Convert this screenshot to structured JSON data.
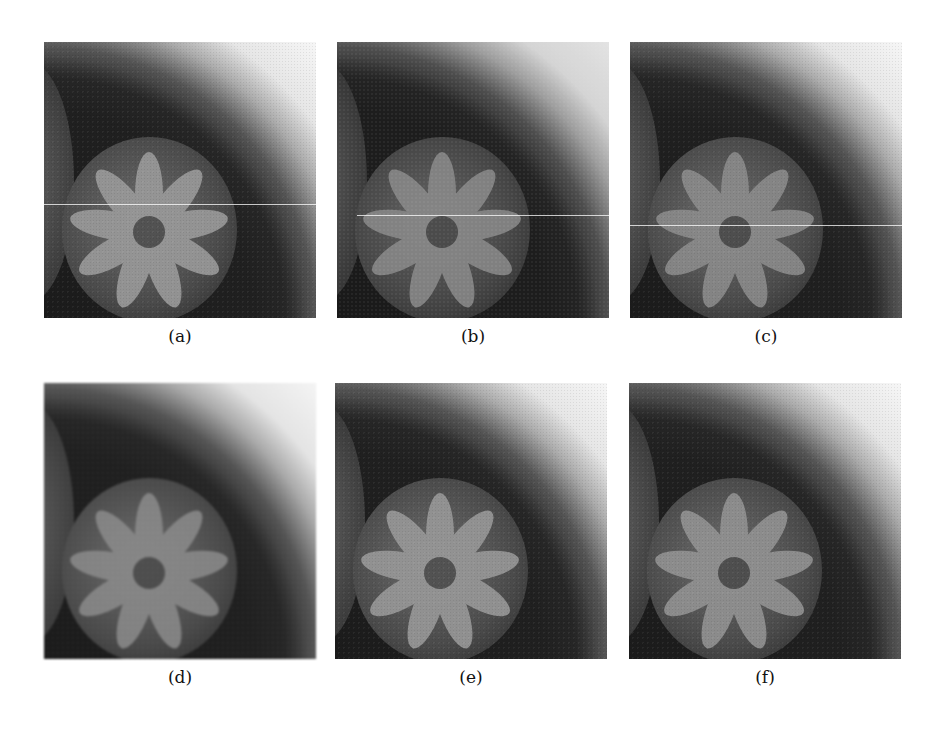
{
  "figure": {
    "panels": [
      {
        "id": "a",
        "label": "(a)",
        "scanline": true,
        "scanline_y": 162,
        "style": "sharp"
      },
      {
        "id": "b",
        "label": "(b)",
        "scanline": true,
        "scanline_y": 173,
        "style": "noisy"
      },
      {
        "id": "c",
        "label": "(c)",
        "scanline": true,
        "scanline_y": 183,
        "style": "blurred"
      },
      {
        "id": "d",
        "label": "(d)",
        "scanline": false,
        "style": "blurred"
      },
      {
        "id": "e",
        "label": "(e)",
        "scanline": false,
        "style": "sharp"
      },
      {
        "id": "f",
        "label": "(f)",
        "scanline": false,
        "style": "sharp"
      }
    ],
    "image_content": "grayscale flower on dark circular surface with curved bright background",
    "colors": {
      "background": "#ffffff",
      "dark_region": "#2a2a2a",
      "bright_region": "#f4f4f4",
      "label_text": "#111111"
    }
  }
}
